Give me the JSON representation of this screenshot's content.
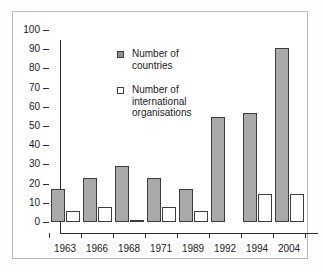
{
  "chart_data": {
    "type": "bar",
    "title": "",
    "xlabel": "",
    "ylabel": "",
    "categories": [
      "1963",
      "1966",
      "1968",
      "1971",
      "1989",
      "1992",
      "1994",
      "2004"
    ],
    "series": [
      {
        "name": "Number of countries",
        "color": "#a9a9a9",
        "values": [
          17,
          23,
          29,
          23,
          17,
          54.5,
          57,
          90.5
        ]
      },
      {
        "name": "Number of international organisations",
        "color": "#ffffff",
        "values": [
          5.5,
          8,
          1,
          8,
          5.5,
          0,
          14.5,
          14.5
        ]
      }
    ],
    "ylim": [
      0,
      100
    ],
    "yticks": [
      0,
      10,
      20,
      30,
      40,
      50,
      60,
      70,
      80,
      90,
      100
    ],
    "ytick_labels": [
      "0",
      "10",
      "20",
      "30",
      "40",
      "50",
      "60",
      "70",
      "80",
      "90",
      "100"
    ],
    "grid": false,
    "legend_position": "inside-upper-left",
    "legend": [
      {
        "label_line1": "Number of",
        "label_line2": "countries",
        "label_line3": "",
        "swatch": "countries"
      },
      {
        "label_line1": "Number of",
        "label_line2": "international",
        "label_line3": "organisations",
        "swatch": "orgs"
      }
    ]
  },
  "colors": {
    "countries_fill": "#a9a9a9",
    "orgs_fill": "#ffffff",
    "bar_border": "#3d3d3d",
    "axis": "#2b2b2b",
    "frame": "#b9b9b9",
    "text": "#1a1a1a",
    "background": "#ffffff"
  }
}
